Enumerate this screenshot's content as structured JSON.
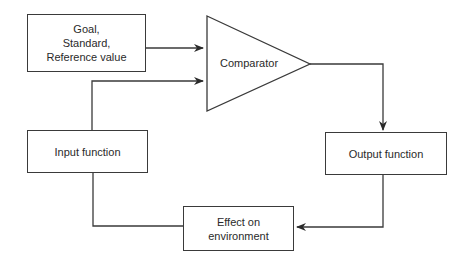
{
  "diagram": {
    "type": "control-loop block diagram",
    "nodes": {
      "goal": {
        "lines": [
          "Goal,",
          "Standard,",
          "Reference value"
        ]
      },
      "comparator": {
        "label": "Comparator"
      },
      "input_function": {
        "label": "Input function"
      },
      "output_function": {
        "label": "Output function"
      },
      "effect": {
        "lines": [
          "Effect on",
          "environment"
        ]
      }
    },
    "edges": [
      {
        "from": "goal",
        "to": "comparator"
      },
      {
        "from": "input_function",
        "to": "comparator"
      },
      {
        "from": "comparator",
        "to": "output_function"
      },
      {
        "from": "output_function",
        "to": "effect"
      },
      {
        "from": "effect",
        "to": "input_function"
      }
    ],
    "colors": {
      "stroke": "#3a3a3a",
      "background": "#ffffff",
      "text": "#2a2a2a"
    }
  }
}
